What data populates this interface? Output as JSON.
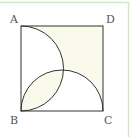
{
  "diagram": {
    "type": "geometry",
    "vertices": [
      {
        "name": "A",
        "label": "A",
        "x": 21,
        "y": 26
      },
      {
        "name": "B",
        "label": "B",
        "x": 21,
        "y": 111
      },
      {
        "name": "C",
        "label": "C",
        "x": 103,
        "y": 111
      },
      {
        "name": "D",
        "label": "D",
        "x": 103,
        "y": 26
      }
    ],
    "labels": {
      "A": "A",
      "B": "B",
      "C": "C",
      "D": "D"
    },
    "arcs": [
      {
        "name": "semicircle-AB",
        "diameter": "AB",
        "bulge": "right"
      },
      {
        "name": "semicircle-BC",
        "diameter": "BC",
        "bulge": "up"
      }
    ],
    "colors": {
      "stroke": "#333333",
      "shade": "#fafaec",
      "border": "#c8e6b4",
      "label": "#555555",
      "background": "#ffffff"
    }
  }
}
